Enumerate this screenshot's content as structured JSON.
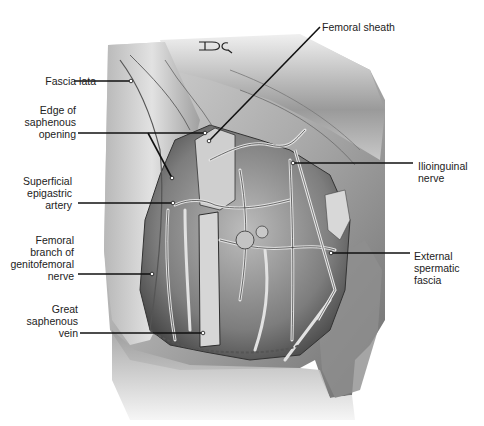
{
  "figure": {
    "artist_monogram": "DC",
    "colors": {
      "background": "#ffffff",
      "skin_light": "#e6e6e6",
      "skin_mid": "#bdbdbd",
      "skin_dark": "#7a7a7a",
      "vessel": "#d9d9d9",
      "vessel_outline": "#3a3a3a",
      "leader_line": "#111111",
      "label_text": "#222222"
    }
  },
  "labels": [
    {
      "id": "fascia-lata",
      "text": "Fascia lata",
      "align": "right",
      "x": 24,
      "y": 75,
      "w": 72
    },
    {
      "id": "edge-saphenous-opening",
      "text": "Edge of\nsaphenous\nopening",
      "align": "right",
      "x": 20,
      "y": 104,
      "w": 56
    },
    {
      "id": "superficial-epigastric-artery",
      "text": "Superficial\nepigastric\nartery",
      "align": "right",
      "x": 14,
      "y": 175,
      "w": 58
    },
    {
      "id": "femoral-branch-genitofemoral-nerve",
      "text": "Femoral\nbranch of\ngenitofemoral\nnerve",
      "align": "right",
      "x": 4,
      "y": 234,
      "w": 70
    },
    {
      "id": "great-saphenous-vein",
      "text": "Great\nsaphenous\nvein",
      "align": "right",
      "x": 14,
      "y": 303,
      "w": 64
    },
    {
      "id": "femoral-sheath",
      "text": "Femoral sheath",
      "align": "left",
      "x": 322,
      "y": 21,
      "w": 100
    },
    {
      "id": "ilioinguinal-nerve",
      "text": "Ilioinguinal\nnerve",
      "align": "left",
      "x": 418,
      "y": 160,
      "w": 64
    },
    {
      "id": "external-spermatic-fascia",
      "text": "External\nspermatic\nfascia",
      "align": "left",
      "x": 414,
      "y": 250,
      "w": 64
    }
  ],
  "leaders": [
    {
      "id": "fascia-lata",
      "points": "74,81 131,81"
    },
    {
      "id": "edge-saphenous-opening-1",
      "points": "78,133 205,133"
    },
    {
      "id": "edge-saphenous-opening-2",
      "points": "148,133 172,178"
    },
    {
      "id": "femoral-sheath",
      "points": "320,27 209,141"
    },
    {
      "id": "superficial-epigastric-artery",
      "points": "78,203 173,203"
    },
    {
      "id": "ilioinguinal-nerve",
      "points": "413,163 293,163"
    },
    {
      "id": "external-spermatic-fascia",
      "points": "410,253 331,253"
    },
    {
      "id": "femoral-branch-genitofemoral-nerve",
      "points": "78,274 152,274"
    },
    {
      "id": "great-saphenous-vein",
      "points": "80,333 203,333"
    }
  ]
}
